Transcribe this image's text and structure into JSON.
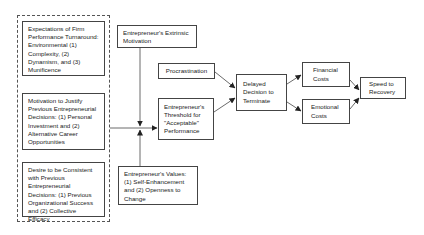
{
  "diagram": {
    "group_left": {
      "boxes": [
        {
          "id": "expectations",
          "label": "Expectations of Firm Performance Turnaround: Environmental (1) Complexity, (2) Dynamism, and (3) Munificence"
        },
        {
          "id": "motivation",
          "label": "Motivation to Justify Previous Entrepreneurial Decisions: (1) Personal Investment and (2) Alternative Career Opportunities"
        },
        {
          "id": "desire",
          "label": "Desire to be Consistent with Previous Entrepreneurial Decisions: (1) Previous Organizational Success and (2) Collective Efficacy"
        }
      ]
    },
    "nodes": {
      "extrinsic": "Entrepreneur's Extrinsic Motivation",
      "values": "Entrepreneur's Values: (1) Self-Enhancement and (2) Openness to Change",
      "procrastination": "Procrastination",
      "threshold": "Entrepreneur's Threshold for \"Acceptable\" Performance",
      "delayed": "Delayed Decision to Terminate",
      "financial": "Financial Costs",
      "emotional": "Emotional Costs",
      "speed": "Speed to Recovery"
    },
    "edges": [
      {
        "from": "group_left",
        "to": "threshold"
      },
      {
        "from": "extrinsic",
        "to": "group_left-threshold link (moderator)"
      },
      {
        "from": "values",
        "to": "group_left-threshold link (moderator)"
      },
      {
        "from": "procrastination",
        "to": "delayed"
      },
      {
        "from": "threshold",
        "to": "delayed"
      },
      {
        "from": "delayed",
        "to": "financial"
      },
      {
        "from": "delayed",
        "to": "emotional"
      },
      {
        "from": "financial",
        "to": "speed"
      },
      {
        "from": "emotional",
        "to": "speed"
      }
    ]
  }
}
